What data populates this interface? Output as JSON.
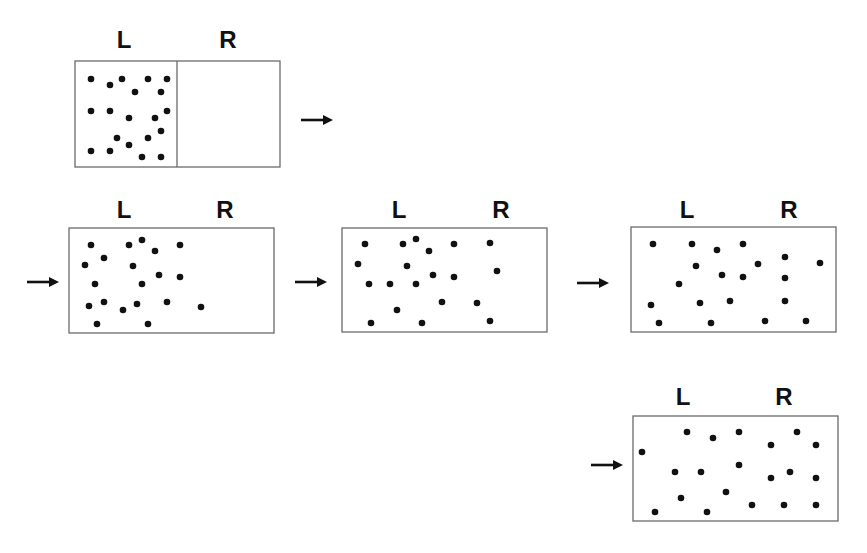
{
  "diagram": {
    "colors": {
      "dot": "#111111",
      "border": "#6a6a6a",
      "text": "#111111"
    },
    "left_label": "L",
    "right_label": "R",
    "panels": [
      {
        "id": "panel-1",
        "box": {
          "x": 75,
          "y": 61,
          "w": 205,
          "h": 106
        },
        "divider_x": 177,
        "labels": {
          "L": [
            124,
            48
          ],
          "R": [
            228,
            48
          ]
        },
        "dots": [
          [
            91,
            79
          ],
          [
            110,
            85
          ],
          [
            122,
            79
          ],
          [
            135,
            92
          ],
          [
            148,
            79
          ],
          [
            161,
            92
          ],
          [
            167,
            79
          ],
          [
            91,
            111
          ],
          [
            110,
            111
          ],
          [
            129,
            118
          ],
          [
            155,
            118
          ],
          [
            167,
            111
          ],
          [
            161,
            131
          ],
          [
            148,
            138
          ],
          [
            117,
            138
          ],
          [
            129,
            145
          ],
          [
            91,
            151
          ],
          [
            110,
            151
          ],
          [
            142,
            157
          ],
          [
            161,
            157
          ]
        ]
      },
      {
        "id": "panel-2",
        "box": {
          "x": 69,
          "y": 228,
          "w": 205,
          "h": 105
        },
        "labels": {
          "L": [
            124,
            218
          ],
          "R": [
            225,
            218
          ]
        },
        "arrow_in": [
          27,
          59,
          282
        ],
        "dots": [
          [
            91,
            245
          ],
          [
            129,
            245
          ],
          [
            142,
            240
          ],
          [
            155,
            251
          ],
          [
            180,
            245
          ],
          [
            104,
            258
          ],
          [
            85,
            265
          ],
          [
            133,
            266
          ],
          [
            159,
            275
          ],
          [
            180,
            277
          ],
          [
            95,
            284
          ],
          [
            142,
            284
          ],
          [
            89,
            306
          ],
          [
            104,
            302
          ],
          [
            123,
            310
          ],
          [
            137,
            304
          ],
          [
            167,
            302
          ],
          [
            201,
            307
          ],
          [
            97,
            324
          ],
          [
            148,
            324
          ]
        ]
      },
      {
        "id": "panel-3",
        "box": {
          "x": 342,
          "y": 228,
          "w": 205,
          "h": 104
        },
        "labels": {
          "L": [
            399,
            218
          ],
          "R": [
            501,
            218
          ]
        },
        "arrow_in": [
          295,
          327,
          282
        ],
        "dots": [
          [
            365,
            244
          ],
          [
            403,
            244
          ],
          [
            416,
            239
          ],
          [
            429,
            251
          ],
          [
            454,
            244
          ],
          [
            490,
            243
          ],
          [
            358,
            264
          ],
          [
            407,
            266
          ],
          [
            433,
            275
          ],
          [
            454,
            277
          ],
          [
            497,
            271
          ],
          [
            369,
            284
          ],
          [
            390,
            284
          ],
          [
            416,
            284
          ],
          [
            442,
            302
          ],
          [
            477,
            303
          ],
          [
            397,
            310
          ],
          [
            371,
            323
          ],
          [
            422,
            323
          ],
          [
            490,
            321
          ]
        ]
      },
      {
        "id": "panel-4",
        "box": {
          "x": 631,
          "y": 227,
          "w": 205,
          "h": 105
        },
        "labels": {
          "L": [
            687,
            218
          ],
          "R": [
            789,
            218
          ]
        },
        "arrow_in": [
          577,
          609,
          283
        ],
        "dots": [
          [
            653,
            244
          ],
          [
            692,
            244
          ],
          [
            717,
            250
          ],
          [
            743,
            244
          ],
          [
            785,
            257
          ],
          [
            696,
            266
          ],
          [
            758,
            264
          ],
          [
            820,
            263
          ],
          [
            722,
            275
          ],
          [
            743,
            277
          ],
          [
            785,
            278
          ],
          [
            679,
            284
          ],
          [
            651,
            305
          ],
          [
            700,
            303
          ],
          [
            730,
            301
          ],
          [
            785,
            301
          ],
          [
            659,
            323
          ],
          [
            711,
            323
          ],
          [
            765,
            321
          ],
          [
            806,
            321
          ]
        ]
      },
      {
        "id": "panel-5",
        "box": {
          "x": 633,
          "y": 416,
          "w": 205,
          "h": 105
        },
        "labels": {
          "L": [
            683,
            405
          ],
          "R": [
            784,
            405
          ]
        },
        "arrow_in": [
          591,
          623,
          465
        ],
        "dots": [
          [
            687,
            432
          ],
          [
            713,
            438
          ],
          [
            739,
            432
          ],
          [
            771,
            445
          ],
          [
            797,
            432
          ],
          [
            816,
            445
          ],
          [
            642,
            452
          ],
          [
            675,
            472
          ],
          [
            701,
            472
          ],
          [
            739,
            465
          ],
          [
            771,
            478
          ],
          [
            790,
            472
          ],
          [
            816,
            478
          ],
          [
            681,
            498
          ],
          [
            726,
            492
          ],
          [
            655,
            512
          ],
          [
            707,
            512
          ],
          [
            752,
            505
          ],
          [
            784,
            505
          ],
          [
            816,
            505
          ]
        ]
      }
    ],
    "arrow_out": [
      301,
      333,
      120
    ]
  }
}
